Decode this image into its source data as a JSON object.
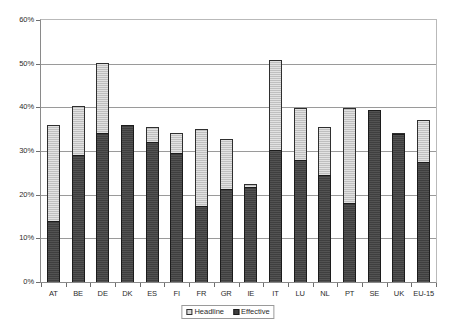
{
  "chart_data": {
    "type": "bar",
    "stacked": true,
    "title": "",
    "subtitle": "",
    "xlabel": "",
    "ylabel": "",
    "ylim": [
      0,
      60
    ],
    "ytick_values": [
      0,
      10,
      20,
      30,
      40,
      50,
      60
    ],
    "ytick_labels": [
      "0%",
      "10%",
      "20%",
      "30%",
      "40%",
      "50%",
      "60%"
    ],
    "grid": true,
    "legend_position": "bottom-center",
    "categories": [
      "AT",
      "BE",
      "DE",
      "DK",
      "ES",
      "FI",
      "FR",
      "GR",
      "IE",
      "IT",
      "LU",
      "NL",
      "PT",
      "SE",
      "UK",
      "EU-15"
    ],
    "series": [
      {
        "name": "Effective",
        "color": "#3f3f3f",
        "values": [
          14.0,
          29.2,
          34.2,
          36.0,
          32.0,
          29.6,
          17.4,
          21.3,
          21.8,
          30.2,
          28.0,
          24.5,
          18.2,
          39.3,
          33.8,
          27.5
        ]
      },
      {
        "name": "Headline",
        "color": "#bfbfbf",
        "values": [
          22.0,
          11.1,
          16.0,
          0.0,
          3.5,
          4.6,
          17.6,
          11.5,
          0.6,
          20.7,
          11.9,
          11.0,
          21.6,
          0.0,
          0.3,
          9.6
        ]
      }
    ],
    "totals": [
      36.0,
      40.3,
      50.2,
      36.0,
      35.5,
      34.2,
      35.0,
      32.8,
      22.4,
      50.9,
      39.9,
      35.5,
      39.8,
      39.3,
      34.1,
      37.1
    ]
  },
  "legend": {
    "items": [
      {
        "label": "Headline",
        "swatch": "headline-swatch"
      },
      {
        "label": "Effective",
        "swatch": "effective-swatch"
      }
    ]
  }
}
